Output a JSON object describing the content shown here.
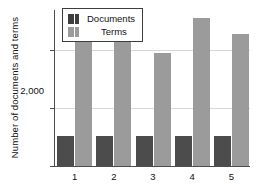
{
  "chart_data": {
    "type": "bar",
    "title": "",
    "xlabel": "",
    "ylabel": "Number of documents and terms",
    "categories": [
      "1",
      "2",
      "3",
      "4",
      "5"
    ],
    "series": [
      {
        "name": "Documents",
        "color": "#4c4c4c",
        "values": [
          520,
          520,
          520,
          520,
          520
        ]
      },
      {
        "name": "Terms",
        "color": "#9b9b9b",
        "values": [
          2300,
          2300,
          1950,
          2570,
          2280
        ]
      }
    ],
    "ylim": [
      0,
      2700
    ],
    "yticks": [
      0,
      1000,
      2000
    ],
    "ytick_labels": [
      "0",
      "1,000",
      "2,000"
    ],
    "grid": true,
    "legend_position": "top-left-inside"
  },
  "legend": {
    "entries": [
      {
        "label": "Documents",
        "swatch": "dark-pair-swatch"
      },
      {
        "label": "Terms",
        "swatch": "light-pair-swatch"
      }
    ]
  }
}
